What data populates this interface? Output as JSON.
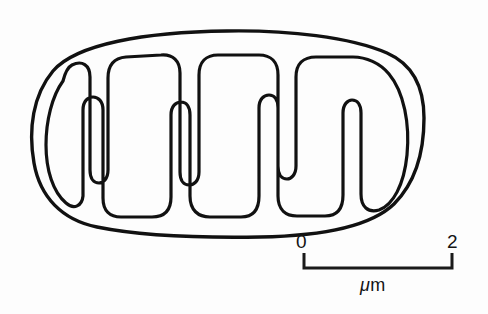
{
  "figure": {
    "kind": "biological-line-diagram",
    "background_color": "#fdfdfd",
    "ink_color": "#111111"
  },
  "diagram": {
    "name": "mitochondrion-cross-section",
    "outer_membrane_label": "outer membrane",
    "inner_membrane_label": "inner membrane",
    "cristae_label": "cristae",
    "crista_count": 7,
    "cristae_from_top": 3,
    "cristae_from_bottom": 4
  },
  "scalebar": {
    "start_label": "0",
    "end_label": "2",
    "unit_mu": "μ",
    "unit_m": "m",
    "unit_label": "μm",
    "length_value": 2,
    "pixels_per_unit": 74.5,
    "bar_left_px": 303,
    "bar_right_px": 452,
    "bar_y_px": 268,
    "tick_height_px": 15,
    "color": "#1a1a1a"
  }
}
